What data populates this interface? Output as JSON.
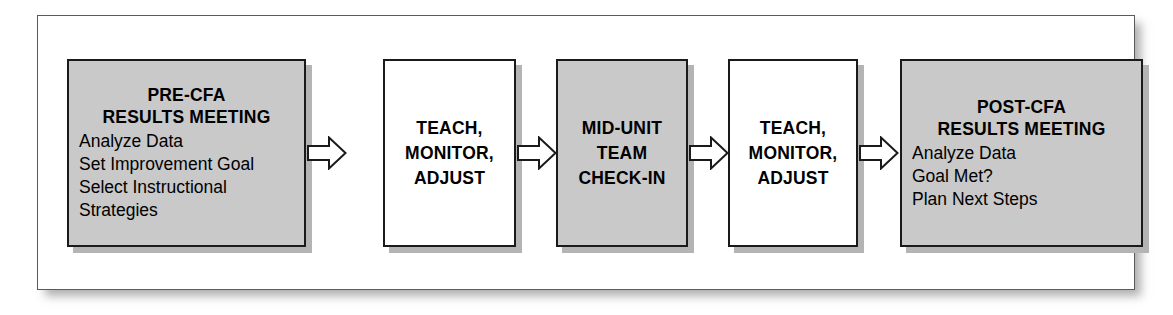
{
  "diagram": {
    "colors": {
      "shaded_fill": "#c9c9c9",
      "plain_fill": "#ffffff",
      "outline": "#1a1a1a",
      "shadow": "#b4b4b4",
      "frame_border": "#5a5a5a",
      "background": "#ffffff"
    },
    "nodes": [
      {
        "id": "pre-cfa-results-meeting",
        "style": "shaded",
        "heading": [
          "PRE-CFA",
          "RESULTS MEETING"
        ],
        "details": [
          "Analyze Data",
          "Set Improvement Goal",
          "Select Instructional",
          "Strategies"
        ]
      },
      {
        "id": "teach-monitor-adjust-1",
        "style": "plain",
        "heading": [
          "TEACH,",
          "MONITOR,",
          "ADJUST"
        ],
        "details": []
      },
      {
        "id": "mid-unit-team-check-in",
        "style": "shaded",
        "heading": [
          "MID-UNIT",
          "TEAM",
          "CHECK-IN"
        ],
        "details": []
      },
      {
        "id": "teach-monitor-adjust-2",
        "style": "plain",
        "heading": [
          "TEACH,",
          "MONITOR,",
          "ADJUST"
        ],
        "details": []
      },
      {
        "id": "post-cfa-results-meeting",
        "style": "shaded",
        "heading": [
          "POST-CFA",
          "RESULTS MEETING"
        ],
        "details": [
          "Analyze Data",
          "Goal Met?",
          "Plan Next Steps"
        ]
      }
    ],
    "connectors": [
      {
        "id": "arrow-1",
        "from": "pre-cfa-results-meeting",
        "to": "teach-monitor-adjust-1",
        "direction": "right"
      },
      {
        "id": "arrow-2",
        "from": "teach-monitor-adjust-1",
        "to": "mid-unit-team-check-in",
        "direction": "right"
      },
      {
        "id": "arrow-3",
        "from": "mid-unit-team-check-in",
        "to": "teach-monitor-adjust-2",
        "direction": "right"
      },
      {
        "id": "arrow-4",
        "from": "teach-monitor-adjust-2",
        "to": "post-cfa-results-meeting",
        "direction": "right"
      }
    ]
  }
}
